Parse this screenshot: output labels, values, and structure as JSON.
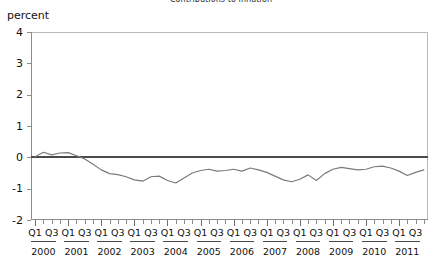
{
  "figure": {
    "title_clipped": "Contributions to inflation",
    "unit_label": "percent"
  },
  "chart_data": {
    "type": "line",
    "title": "Contributions to inflation",
    "xlabel": "",
    "ylabel": "percent",
    "ylim": [
      -2,
      4
    ],
    "yticks": [
      4,
      3,
      2,
      1,
      0,
      -1,
      -2
    ],
    "grid": false,
    "legend": "none",
    "zero_reference_line": 0,
    "quarter_tick_labels": [
      "Q1",
      "Q3"
    ],
    "year_categories": [
      "2000",
      "2001",
      "2002",
      "2003",
      "2004",
      "2005",
      "2006",
      "2007",
      "2008",
      "2009",
      "2010",
      "2011"
    ],
    "x": [
      "2000Q1",
      "2000Q2",
      "2000Q3",
      "2000Q4",
      "2001Q1",
      "2001Q2",
      "2001Q3",
      "2001Q4",
      "2002Q1",
      "2002Q2",
      "2002Q3",
      "2002Q4",
      "2003Q1",
      "2003Q2",
      "2003Q3",
      "2003Q4",
      "2004Q1",
      "2004Q2",
      "2004Q3",
      "2004Q4",
      "2005Q1",
      "2005Q2",
      "2005Q3",
      "2005Q4",
      "2006Q1",
      "2006Q2",
      "2006Q3",
      "2006Q4",
      "2007Q1",
      "2007Q2",
      "2007Q3",
      "2007Q4",
      "2008Q1",
      "2008Q2",
      "2008Q3",
      "2008Q4",
      "2009Q1",
      "2009Q2",
      "2009Q3",
      "2009Q4",
      "2010Q1",
      "2010Q2",
      "2010Q3",
      "2010Q4",
      "2011Q1",
      "2011Q2",
      "2011Q3",
      "2011Q4"
    ],
    "series": [
      {
        "name": "contribution",
        "color": "#7a7a7a",
        "values": [
          0.02,
          0.16,
          0.08,
          0.14,
          0.15,
          0.05,
          -0.05,
          -0.22,
          -0.4,
          -0.52,
          -0.55,
          -0.62,
          -0.72,
          -0.76,
          -0.62,
          -0.6,
          -0.74,
          -0.82,
          -0.66,
          -0.5,
          -0.42,
          -0.38,
          -0.44,
          -0.42,
          -0.38,
          -0.44,
          -0.34,
          -0.4,
          -0.48,
          -0.6,
          -0.72,
          -0.78,
          -0.7,
          -0.56,
          -0.74,
          -0.52,
          -0.38,
          -0.32,
          -0.36,
          -0.4,
          -0.38,
          -0.3,
          -0.28,
          -0.34,
          -0.44,
          -0.58,
          -0.48,
          -0.4
        ]
      }
    ]
  }
}
